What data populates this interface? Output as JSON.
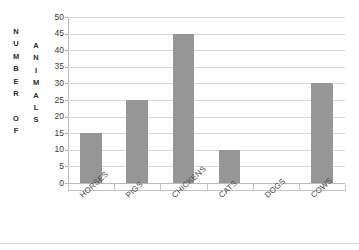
{
  "chart_data": {
    "type": "bar",
    "title": "",
    "xlabel": "",
    "ylabel": "NUMBER OF ANIMALS",
    "categories": [
      "HORSES",
      "PIGS",
      "CHICKENS",
      "CATS",
      "DOGS",
      "COWS"
    ],
    "values": [
      15,
      25,
      45,
      10,
      0,
      30
    ],
    "ylim": [
      0,
      50
    ],
    "ytick_step": 5,
    "yticks": [
      50,
      45,
      40,
      35,
      30,
      25,
      20,
      15,
      10,
      5,
      0
    ],
    "grid": true,
    "legend": false,
    "bar_color": "#969696",
    "gridline_color": "#d9d9d9",
    "axis_color": "#b9b9b9"
  },
  "axis_titles": {
    "y_primary_letters": [
      "N",
      "U",
      "M",
      "B",
      "E",
      "R",
      "",
      "O",
      "F"
    ],
    "y_secondary_letters": [
      "A",
      "N",
      "I",
      "M",
      "A",
      "L",
      "S"
    ],
    "y_primary_text": "NUMBER OF",
    "y_secondary_text": "ANIMALS"
  },
  "chart_title_fragment": ""
}
